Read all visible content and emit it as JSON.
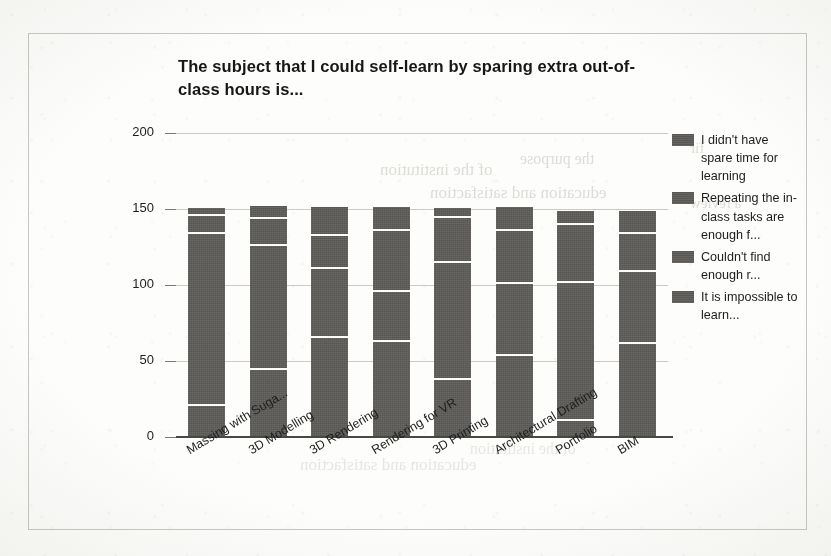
{
  "chart_data": {
    "type": "bar",
    "subtype": "stacked-bar",
    "title": "The subject that I could self-learn by sparing extra out-of-class hours is...",
    "xlabel": "",
    "ylabel": "",
    "ylim": [
      0,
      200
    ],
    "yticks": [
      0,
      50,
      100,
      150,
      200
    ],
    "grid": true,
    "legend_position": "right",
    "categories": [
      "Massing with Suga...",
      "3D Modelling",
      "3D Rendering",
      "Rendering for VR",
      "3D Printing",
      "Architectural Drafting",
      "Portfolio",
      "BIM"
    ],
    "series": [
      {
        "name": "I didn't have spare time for learning",
        "values": [
          5,
          8,
          18,
          15,
          6,
          15,
          9,
          15
        ]
      },
      {
        "name": "Repeating the in-class tasks are enough f...",
        "values": [
          12,
          18,
          22,
          40,
          30,
          35,
          38,
          25
        ]
      },
      {
        "name": "Couldn't find enough r...",
        "values": [
          113,
          81,
          45,
          33,
          77,
          47,
          91,
          47
        ]
      },
      {
        "name": "It is impossible to learn...",
        "values": [
          21,
          45,
          66,
          63,
          38,
          54,
          11,
          62
        ]
      }
    ],
    "series_short": [
      "I didn't have spare time for learning",
      "Repeating the in-class tasks are enough f...",
      "Couldn't find enough r...",
      "It is impossible to learn..."
    ],
    "totals": [
      151,
      152,
      151,
      151,
      151,
      151,
      149,
      149
    ],
    "bar_color": "#5d5c59",
    "grid_color": "#cdcac4",
    "axis_color": "#4a4843",
    "text_color": "#1d1d1d"
  },
  "page": {
    "background": "#fdfdfb",
    "frame_color": "#c9c6c0"
  },
  "ghost_text": [
    "of the institution",
    "the purpose",
    "education and satisfaction",
    "a review",
    "fir"
  ]
}
